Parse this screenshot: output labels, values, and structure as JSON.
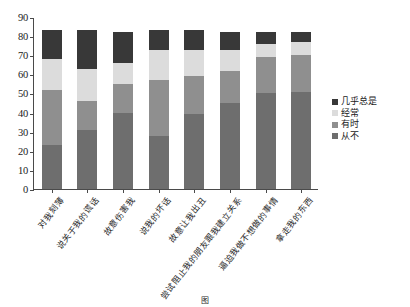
{
  "chart_data": {
    "type": "bar",
    "subtype": "stacked-bar",
    "title": "",
    "xlabel": "",
    "ylabel": "",
    "ylim": [
      0,
      90
    ],
    "yticks": [
      0,
      10,
      20,
      30,
      40,
      50,
      60,
      70,
      80,
      90
    ],
    "grid": false,
    "legend_position": "right",
    "categories": [
      "对我刻薄",
      "说关于我的谎话",
      "故意伤害我",
      "说我的坏话",
      "故意让我出丑",
      "尝试阻止我的朋友跟我建立关系",
      "逼迫我做不想做的事情",
      "拿走我的东西"
    ],
    "series": [
      {
        "name": "从不",
        "color": "#6e6e6e",
        "values": [
          23,
          31,
          40,
          28,
          39,
          45,
          50,
          51
        ]
      },
      {
        "name": "有时",
        "color": "#8f8f8f",
        "values": [
          29,
          15,
          15,
          29,
          20,
          17,
          19,
          19
        ]
      },
      {
        "name": "经常",
        "color": "#dcdcdc",
        "values": [
          16,
          17,
          11,
          16,
          14,
          11,
          7,
          7
        ]
      },
      {
        "name": "几乎总是",
        "color": "#383838",
        "values": [
          15,
          20,
          16,
          10,
          10,
          9,
          6,
          5
        ]
      }
    ],
    "stack_order_bottom_to_top": [
      "从不",
      "有时",
      "经常",
      "几乎总是"
    ],
    "bar_totals": [
      83,
      83,
      82,
      83,
      83,
      82,
      82,
      82
    ],
    "legend_entries": [
      {
        "label": "几乎总是",
        "color": "#383838"
      },
      {
        "label": "经常",
        "color": "#dcdcdc"
      },
      {
        "label": "有时",
        "color": "#8f8f8f"
      },
      {
        "label": "从不",
        "color": "#6e6e6e"
      }
    ]
  },
  "caption": "图",
  "axis": {
    "y_tick_labels": [
      "0",
      "10",
      "20",
      "30",
      "40",
      "50",
      "60",
      "70",
      "80",
      "90"
    ]
  }
}
